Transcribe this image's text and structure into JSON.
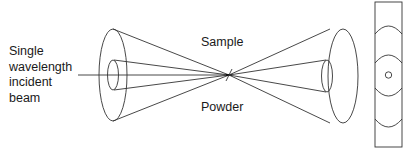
{
  "diagram": {
    "labels": {
      "beam": [
        "Single",
        "wavelength",
        "incident",
        "beam"
      ],
      "sample": "Sample",
      "powder": "Powder"
    },
    "colors": {
      "line": "#333333",
      "text": "#1a1a1a",
      "background": "#ffffff"
    },
    "elements": [
      "incident-beam-line",
      "left-diffraction-cone",
      "powder-sample-point",
      "right-diffraction-cone",
      "film-strip-with-rings"
    ]
  }
}
